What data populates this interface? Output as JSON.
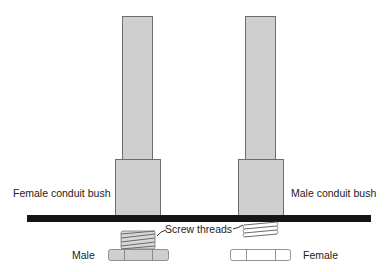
{
  "diagram": {
    "colors": {
      "fill": "#cfcfcf",
      "stroke": "#6e6e6e",
      "panel": "#151515",
      "thread_fill": "#d8d8d8",
      "text": "#222222"
    },
    "labels": {
      "female_bush": "Female conduit bush",
      "male_bush": "Male conduit bush",
      "screw_threads": "Screw threads",
      "male": "Male",
      "female": "Female"
    },
    "components": [
      {
        "id": "left-rod",
        "type": "conduit-pipe"
      },
      {
        "id": "left-bush",
        "type": "female-conduit-bush"
      },
      {
        "id": "right-rod",
        "type": "conduit-pipe"
      },
      {
        "id": "right-bush",
        "type": "male-conduit-bush"
      },
      {
        "id": "panel",
        "type": "panel"
      },
      {
        "id": "male-threads",
        "type": "screw-threads"
      },
      {
        "id": "male-nut",
        "type": "male-nut"
      },
      {
        "id": "female-threads",
        "type": "screw-threads"
      },
      {
        "id": "female-nut",
        "type": "female-nut"
      }
    ]
  }
}
